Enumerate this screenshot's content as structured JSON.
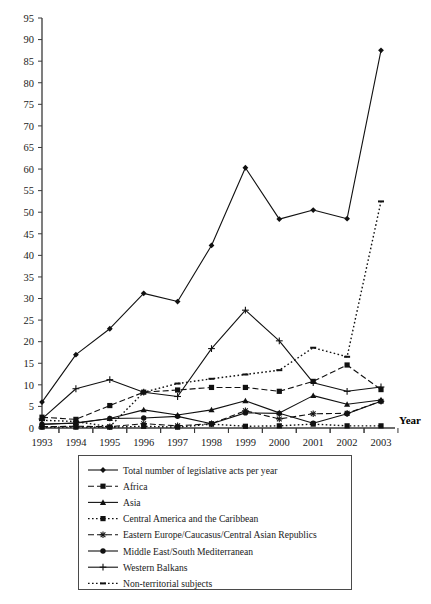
{
  "chart_data": {
    "type": "line",
    "title": "",
    "xlabel": "Year",
    "ylabel": "",
    "categories": [
      "1993",
      "1994",
      "1995",
      "1996",
      "1997",
      "1998",
      "1999",
      "2000",
      "2001",
      "2002",
      "2003"
    ],
    "x": [
      1993,
      1994,
      1995,
      1996,
      1997,
      1998,
      1999,
      2000,
      2001,
      2002,
      2003
    ],
    "ylim": [
      0,
      95
    ],
    "ytick_step": 5,
    "yticks": [
      0,
      5,
      10,
      15,
      20,
      25,
      30,
      35,
      40,
      45,
      50,
      55,
      60,
      65,
      70,
      75,
      80,
      85,
      90,
      95
    ],
    "grid": false,
    "legend_position": "below-plot",
    "series": [
      {
        "name": "Total number of legislative acts per year",
        "marker": "diamond",
        "line_style": "solid",
        "values": [
          6,
          17,
          23,
          31.2,
          29.3,
          42.3,
          60.3,
          48.4,
          50.5,
          48.5,
          87.5
        ]
      },
      {
        "name": "Africa",
        "marker": "square",
        "line_style": "dashed",
        "values": [
          2.5,
          2,
          5.2,
          8.3,
          8.8,
          9.4,
          9.4,
          8.5,
          10.8,
          14.6,
          8.9
        ]
      },
      {
        "name": "Asia",
        "marker": "triangle",
        "line_style": "solid",
        "values": [
          0.8,
          1.2,
          2.2,
          4.2,
          3,
          4.2,
          6.3,
          3.5,
          7.5,
          5.5,
          6.5
        ]
      },
      {
        "name": "Central America and the Caribbean",
        "marker": "square",
        "line_style": "dotted",
        "values": [
          0.2,
          0.2,
          0.2,
          0.4,
          0.2,
          0.9,
          0.4,
          0.5,
          0.9,
          0.5,
          0.5
        ]
      },
      {
        "name": "Eastern Europe/Caucasus/Central Asian Republics",
        "marker": "asterisk",
        "line_style": "dashed",
        "values": [
          0.3,
          0.4,
          0.3,
          1,
          0.5,
          1,
          4,
          2.1,
          3.3,
          3.4,
          6.2
        ]
      },
      {
        "name": "Middle East/South Mediterranean",
        "marker": "circle",
        "line_style": "solid",
        "values": [
          0.9,
          1.1,
          2.2,
          2.3,
          2.7,
          1,
          3.5,
          3.4,
          1.1,
          3.3,
          6.2
        ]
      },
      {
        "name": "Western Balkans",
        "marker": "plus",
        "line_style": "solid",
        "values": [
          2.1,
          9.1,
          11.2,
          8.3,
          7.3,
          18.4,
          27.3,
          20.2,
          10.5,
          8.5,
          9.5
        ]
      },
      {
        "name": "Non-territorial subjects",
        "marker": "dash",
        "line_style": "dotted",
        "values": [
          1.8,
          1.5,
          0.3,
          8.3,
          10.3,
          11.4,
          12.4,
          13.4,
          18.6,
          16.5,
          52.5
        ]
      }
    ]
  },
  "axis": {
    "x_title": "Year",
    "x_tick_labels": [
      "1993",
      "1994",
      "1995",
      "1996",
      "1997",
      "1998",
      "1999",
      "2000",
      "2001",
      "2002",
      "2003"
    ],
    "y_tick_labels": [
      "0",
      "5",
      "10",
      "15",
      "20",
      "25",
      "30",
      "35",
      "40",
      "45",
      "50",
      "55",
      "60",
      "65",
      "70",
      "75",
      "80",
      "85",
      "90",
      "95"
    ]
  },
  "legend": {
    "items": [
      {
        "label": "Total number of legislative acts per year",
        "marker": "diamond",
        "line_style": "solid"
      },
      {
        "label": "Africa",
        "marker": "square",
        "line_style": "dashed"
      },
      {
        "label": "Asia",
        "marker": "triangle",
        "line_style": "solid"
      },
      {
        "label": "Central America and the Caribbean",
        "marker": "square",
        "line_style": "dotted"
      },
      {
        "label": "Eastern Europe/Caucasus/Central Asian Republics",
        "marker": "asterisk",
        "line_style": "dashed"
      },
      {
        "label": "Middle East/South Mediterranean",
        "marker": "circle",
        "line_style": "solid"
      },
      {
        "label": "Western Balkans",
        "marker": "plus",
        "line_style": "solid"
      },
      {
        "label": "Non-territorial subjects",
        "marker": "dash",
        "line_style": "dotted"
      }
    ]
  },
  "colors": {
    "line": "#111111",
    "axis": "#3a3a3a",
    "text": "#1a1a1a",
    "background": "#ffffff"
  }
}
